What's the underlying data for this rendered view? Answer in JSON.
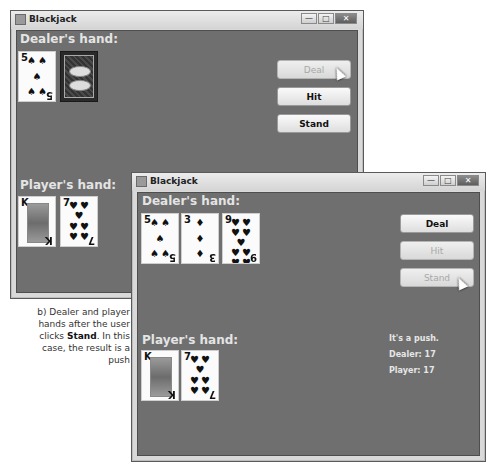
{
  "window_a": {
    "title": "Blackjack",
    "dealer_label": "Dealer's hand:",
    "player_label": "Player's hand:",
    "dealer_cards": [
      {
        "rank": "5",
        "suit": "spades",
        "symbol": "♠"
      },
      {
        "rank": "",
        "suit": "",
        "symbol": "",
        "face_down": true,
        "back_text": "DEAL"
      }
    ],
    "player_cards": [
      {
        "rank": "K",
        "suit": "spades",
        "symbol": "♠"
      },
      {
        "rank": "7",
        "suit": "hearts",
        "symbol": "♥"
      }
    ],
    "buttons": {
      "deal": {
        "label": "Deal",
        "enabled": false
      },
      "hit": {
        "label": "Hit",
        "enabled": true
      },
      "stand": {
        "label": "Stand",
        "enabled": true
      }
    },
    "controls": {
      "minimize": "—",
      "maximize": "□",
      "close": "✕"
    }
  },
  "window_b": {
    "title": "Blackjack",
    "dealer_label": "Dealer's hand:",
    "player_label": "Player's hand:",
    "dealer_cards": [
      {
        "rank": "5",
        "suit": "spades",
        "symbol": "♠"
      },
      {
        "rank": "3",
        "suit": "diamonds",
        "symbol": "♦"
      },
      {
        "rank": "9",
        "suit": "hearts",
        "symbol": "♥"
      }
    ],
    "player_cards": [
      {
        "rank": "K",
        "suit": "spades",
        "symbol": "♠"
      },
      {
        "rank": "7",
        "suit": "hearts",
        "symbol": "♥"
      }
    ],
    "buttons": {
      "deal": {
        "label": "Deal",
        "enabled": true
      },
      "hit": {
        "label": "Hit",
        "enabled": false
      },
      "stand": {
        "label": "Stand",
        "enabled": false
      }
    },
    "status": {
      "result": "It's a push.",
      "dealer_total": "Dealer: 17",
      "player_total": "Player: 17"
    },
    "controls": {
      "minimize": "—",
      "maximize": "□",
      "close": "✕"
    }
  },
  "caption": {
    "line1": "b) Dealer and player",
    "line2": "hands after the user",
    "line3_pre": "clicks ",
    "line3_bold": "Stand",
    "line3_post": ". In this",
    "line4": "case, the result is a push"
  },
  "colors": {
    "table_bg": "#6f6f6f",
    "label_text": "#e4e4e4",
    "button_disabled_text": "#a8a8a8"
  }
}
